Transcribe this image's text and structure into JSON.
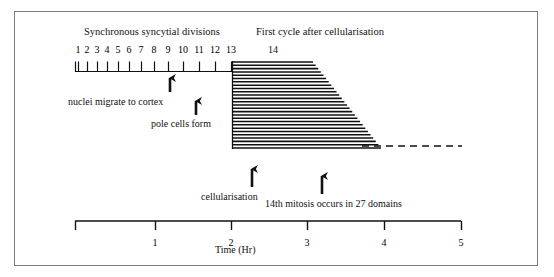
{
  "figure": {
    "title_top_left": "Synchronous syncytial divisions",
    "title_top_right": "First cycle after cellularisation",
    "cycle_label_14": "14"
  },
  "cycle_ticks": {
    "labels": [
      "1",
      "2",
      "3",
      "4",
      "5",
      "6",
      "7",
      "8",
      "9",
      "10",
      "11",
      "12",
      "13"
    ],
    "x_positions": [
      78,
      87,
      97,
      107,
      118,
      129,
      141,
      154,
      168,
      183,
      199,
      215,
      231
    ]
  },
  "annotations": [
    {
      "id": "nuclei",
      "label": "nuclei migrate to cortex",
      "arrow_x": 170,
      "arrow_top": 72,
      "arrow_bottom": 92
    },
    {
      "id": "pole",
      "label": "pole cells form",
      "arrow_x": 196,
      "arrow_top": 95,
      "arrow_bottom": 115
    },
    {
      "id": "cellularisation",
      "label": "cellularisation",
      "arrow_x": 252,
      "arrow_top": 163,
      "arrow_bottom": 187
    },
    {
      "id": "mitosis",
      "label": "14th mitosis occurs in 27 domains",
      "arrow_x": 322,
      "arrow_top": 170,
      "arrow_bottom": 194
    }
  ],
  "time_axis": {
    "label": "Time (Hr)",
    "ticks": [
      "1",
      "2",
      "3",
      "4",
      "5"
    ],
    "tick_x": [
      155,
      231,
      307,
      384,
      461
    ],
    "origin_x": 75,
    "end_x": 461,
    "baseline_y": 221,
    "tick_length": 9
  },
  "domain_block": {
    "description": "27 horizontal lines representing 27 mitotic domains",
    "line_count": 27,
    "left_x": 232,
    "top_y": 62,
    "bottom_y": 148,
    "right_top_x": 313,
    "right_bottom_x": 381,
    "dashed_from_x": 362,
    "dashed_to_x": 462,
    "dashed_y": 146
  },
  "colors": {
    "ink": "#111111",
    "frame": "#7e7e7e",
    "background": "#ffffff"
  },
  "chart_data": {
    "type": "line",
    "xlabel": "Time (Hr)",
    "ylabel": "",
    "xlim": [
      0,
      5
    ],
    "grid": false,
    "legend": "none",
    "annotations": [
      "Synchronous syncytial divisions",
      "First cycle after cellularisation",
      "nuclei migrate to cortex",
      "pole cells form",
      "cellularisation",
      "14th mitosis occurs in 27 domains"
    ],
    "series": [
      {
        "name": "Syncytial division cycles (tick marks)",
        "categories": [
          "1",
          "2",
          "3",
          "4",
          "5",
          "6",
          "7",
          "8",
          "9",
          "10",
          "11",
          "12",
          "13"
        ],
        "x_hours": [
          0.04,
          0.16,
          0.29,
          0.42,
          0.56,
          0.7,
          0.86,
          1.03,
          1.21,
          1.4,
          1.61,
          1.82,
          2.03
        ]
      },
      {
        "name": "Cycle 14 mitotic domains",
        "domain_count": 27,
        "x_start_hours": 2.04,
        "x_end_first_domain_hours": 3.1,
        "x_end_last_domain_hours": 3.98,
        "dashed_continuation_to_hours": 5.0
      }
    ],
    "event_markers": [
      {
        "label": "nuclei migrate to cortex",
        "x_hours": 1.23
      },
      {
        "label": "pole cells form",
        "x_hours": 1.57
      },
      {
        "label": "cellularisation",
        "x_hours": 2.3
      },
      {
        "label": "14th mitosis occurs in 27 domains",
        "x_hours": 3.21
      }
    ]
  }
}
